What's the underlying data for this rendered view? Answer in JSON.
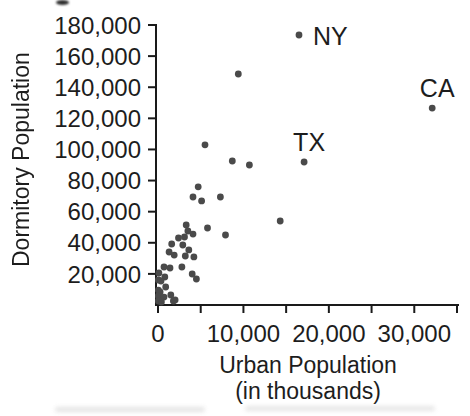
{
  "figure": {
    "background": "#ffffff",
    "dot_color": "#4a4a4a",
    "axis_color": "#1a1a1a",
    "text_color": "#1d1d1d"
  },
  "chart_data": {
    "type": "scatter",
    "title": "",
    "xlabel": "Urban Population",
    "xlabel_sub": "(in thousands)",
    "ylabel": "Dormitory Population",
    "xlim": [
      0,
      35000
    ],
    "ylim": [
      0,
      180000
    ],
    "grid": false,
    "legend": "none",
    "x_ticks": [
      {
        "v": 0,
        "label": "0"
      },
      {
        "v": 5000,
        "label": ""
      },
      {
        "v": 10000,
        "label": "10,000"
      },
      {
        "v": 15000,
        "label": ""
      },
      {
        "v": 20000,
        "label": "20,000"
      },
      {
        "v": 25000,
        "label": ""
      },
      {
        "v": 30000,
        "label": "30,000"
      },
      {
        "v": 35000,
        "label": ""
      }
    ],
    "y_ticks": [
      {
        "v": 20000,
        "label": "20,000"
      },
      {
        "v": 40000,
        "label": "40,000"
      },
      {
        "v": 60000,
        "label": "60,000"
      },
      {
        "v": 80000,
        "label": "80,000"
      },
      {
        "v": 100000,
        "label": "100,000"
      },
      {
        "v": 120000,
        "label": "120,000"
      },
      {
        "v": 140000,
        "label": "140,000"
      },
      {
        "v": 160000,
        "label": "160,000"
      },
      {
        "v": 180000,
        "label": "180,000"
      }
    ],
    "labeled_points": [
      {
        "label": "NY",
        "x": 16500,
        "y": 173600,
        "label_side": "right"
      },
      {
        "label": "CA",
        "x": 32100,
        "y": 126600,
        "label_side": "above"
      },
      {
        "label": "TX",
        "x": 17100,
        "y": 91900,
        "label_side": "above"
      }
    ],
    "points": [
      [
        9400,
        148500
      ],
      [
        5500,
        103000
      ],
      [
        8700,
        92600
      ],
      [
        10700,
        90000
      ],
      [
        4700,
        76000
      ],
      [
        7300,
        69400
      ],
      [
        4100,
        69400
      ],
      [
        5100,
        66900
      ],
      [
        14300,
        54000
      ],
      [
        3300,
        51400
      ],
      [
        5800,
        49500
      ],
      [
        7900,
        45000
      ],
      [
        3500,
        47600
      ],
      [
        4100,
        45600
      ],
      [
        2400,
        43100
      ],
      [
        3100,
        43700
      ],
      [
        1600,
        39200
      ],
      [
        2900,
        38600
      ],
      [
        3600,
        35400
      ],
      [
        1300,
        34100
      ],
      [
        1900,
        32100
      ],
      [
        3200,
        31500
      ],
      [
        4200,
        30900
      ],
      [
        700,
        24400
      ],
      [
        1400,
        23800
      ],
      [
        2800,
        24400
      ],
      [
        100,
        20600
      ],
      [
        800,
        18000
      ],
      [
        4000,
        19900
      ],
      [
        50,
        16100
      ],
      [
        350,
        15400
      ],
      [
        4500,
        16700
      ],
      [
        900,
        11600
      ],
      [
        50,
        9600
      ],
      [
        250,
        8400
      ],
      [
        1500,
        6400
      ],
      [
        50,
        5800
      ],
      [
        700,
        5100
      ],
      [
        2000,
        3200
      ],
      [
        1800,
        2600
      ],
      [
        50,
        2600
      ],
      [
        400,
        1900
      ]
    ]
  }
}
